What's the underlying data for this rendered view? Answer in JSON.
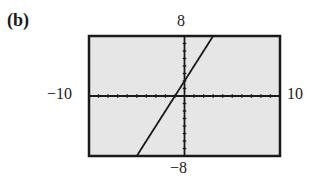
{
  "panel": {
    "label": "(b)"
  },
  "window": {
    "xmin_label": "−10",
    "xmax_label": "10",
    "ymin_label": "−8",
    "ymax_label": "8"
  },
  "colors": {
    "screen_bg": "#e6e6e6",
    "frame": "#1a1a1a",
    "axis": "#1a1a1a",
    "line": "#1a1a1a"
  },
  "chart_data": {
    "type": "line",
    "title": "",
    "panel_label": "(b)",
    "xlabel": "",
    "ylabel": "",
    "xlim": [
      -10,
      10
    ],
    "ylim": [
      -8,
      8
    ],
    "xscale": 1,
    "yscale": 1,
    "grid": false,
    "tick_labels": {
      "x": [
        "-10",
        "10"
      ],
      "y": [
        "-8",
        "8"
      ]
    },
    "series": [
      {
        "name": "y = 2x + 2",
        "style": "dotted calculator-style line",
        "x": [
          -5,
          -4,
          -3,
          -2,
          -1,
          0,
          1,
          2,
          3
        ],
        "y": [
          -8,
          -6,
          -4,
          -2,
          0,
          2,
          4,
          6,
          8
        ]
      }
    ]
  }
}
